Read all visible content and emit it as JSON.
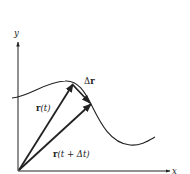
{
  "diagram": {
    "axes": {
      "x_label": "x",
      "y_label": "y"
    },
    "vectors": [
      {
        "id": "r_t",
        "label_bold": "r",
        "label_rest": "(t)"
      },
      {
        "id": "r_t_dt",
        "label_bold": "r",
        "label_rest": "(t + Δt)"
      },
      {
        "id": "delta_r",
        "label_prefix": "Δ",
        "label_bold": "r"
      }
    ],
    "colors": {
      "ink": "#222222",
      "background": "#ffffff"
    }
  }
}
